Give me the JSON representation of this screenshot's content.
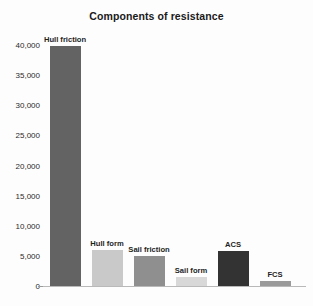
{
  "chart_data": {
    "type": "bar",
    "title": "Components of resistance",
    "xlabel": "",
    "ylabel": "",
    "categories": [
      "Hull friction",
      "Hull form",
      "Sail friction",
      "Sail form",
      "ACS",
      "FCS"
    ],
    "values": [
      39800,
      6000,
      5000,
      1500,
      5800,
      800
    ],
    "ylim": [
      0,
      40000
    ],
    "yticks": [
      0,
      5000,
      10000,
      15000,
      20000,
      25000,
      30000,
      35000,
      40000
    ],
    "ytick_labels": [
      "0",
      "5,000",
      "10,000",
      "15,000",
      "20,000",
      "25,000",
      "30,000",
      "35,000",
      "40,000"
    ],
    "grid": false,
    "legend": "none",
    "bar_colors": [
      "#636363",
      "#c9c9c9",
      "#8f8f8f",
      "#d8d8d8",
      "#333333",
      "#9a9a9a"
    ],
    "bar_labels": [
      "Hull friction",
      "Hull form",
      "Sail friction",
      "Sail form",
      "ACS",
      "FCS"
    ],
    "axis_color": "#b9b9b9",
    "background": "#fdfdfd",
    "title_color": "#1a1a1a",
    "label_color": "#1f1f1f"
  }
}
